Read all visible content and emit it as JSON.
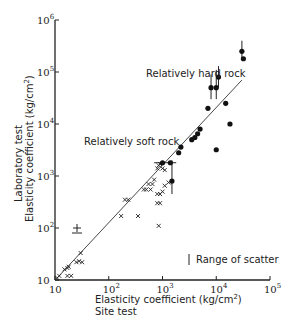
{
  "chart_data": {
    "type": "scatter",
    "title": "",
    "xlabel": "Elasticity coefficient (kg/cm²)",
    "xlabel_sub": "Site test",
    "ylabel": "Elasticity coefficient (kg/cm²)",
    "ylabel_sub": "Laboratory test",
    "xscale": "log",
    "yscale": "log",
    "xlim": [
      10,
      100000
    ],
    "ylim": [
      10,
      1000000
    ],
    "x_ticks": [
      {
        "base": "10",
        "exp": ""
      },
      {
        "base": "10",
        "exp": "2"
      },
      {
        "base": "10",
        "exp": "3"
      },
      {
        "base": "10",
        "exp": "4"
      },
      {
        "base": "10",
        "exp": "5"
      }
    ],
    "y_ticks": [
      {
        "base": "10",
        "exp": ""
      },
      {
        "base": "10",
        "exp": "2"
      },
      {
        "base": "10",
        "exp": "3"
      },
      {
        "base": "10",
        "exp": "4"
      },
      {
        "base": "10",
        "exp": "5"
      },
      {
        "base": "10",
        "exp": "6"
      }
    ],
    "grid": false,
    "annotations": [
      {
        "text": "Relatively hard rock",
        "x": 1200,
        "y": 80000
      },
      {
        "text": "Relatively soft rock",
        "x": 100,
        "y": 5500
      },
      {
        "text": "Range of scatter",
        "x": 5500,
        "y": 30
      }
    ],
    "reference_line": {
      "label": "y = x",
      "from": [
        11,
        11
      ],
      "to": [
        30000,
        70000
      ]
    },
    "series": [
      {
        "name": "Relatively soft rock",
        "marker": "x",
        "points": [
          [
            11,
            11
          ],
          [
            12,
            12
          ],
          [
            15,
            16
          ],
          [
            17,
            17
          ],
          [
            18,
            18
          ],
          [
            17,
            12
          ],
          [
            20,
            12
          ],
          [
            25,
            22
          ],
          [
            28,
            23
          ],
          [
            30,
            33
          ],
          [
            32,
            22
          ],
          [
            200,
            350
          ],
          [
            230,
            350
          ],
          [
            170,
            170
          ],
          [
            350,
            170
          ],
          [
            450,
            550
          ],
          [
            500,
            550
          ],
          [
            600,
            550
          ],
          [
            550,
            700
          ],
          [
            650,
            700
          ],
          [
            700,
            850
          ],
          [
            800,
            1400
          ],
          [
            900,
            1700
          ],
          [
            1000,
            1400
          ],
          [
            850,
            1600
          ],
          [
            1100,
            1300
          ],
          [
            1000,
            500
          ],
          [
            800,
            450
          ],
          [
            900,
            450
          ],
          [
            800,
            300
          ],
          [
            900,
            300
          ],
          [
            1100,
            650
          ],
          [
            1300,
            750
          ],
          [
            850,
            110
          ]
        ]
      },
      {
        "name": "Relatively hard rock",
        "marker": "filled-circle",
        "points": [
          [
            1000,
            1800
          ],
          [
            1400,
            1800
          ],
          [
            1500,
            800
          ],
          [
            2000,
            2800
          ],
          [
            2200,
            3600
          ],
          [
            3500,
            5000
          ],
          [
            4000,
            5500
          ],
          [
            4500,
            6500
          ],
          [
            5000,
            8000
          ],
          [
            7000,
            20000
          ],
          [
            8000,
            50000
          ],
          [
            10000,
            50000
          ],
          [
            11000,
            80000
          ],
          [
            10000,
            3200
          ],
          [
            15000,
            25000
          ],
          [
            18000,
            10000
          ],
          [
            30000,
            250000
          ],
          [
            32000,
            180000
          ]
        ]
      }
    ],
    "error_bars": [
      {
        "x": 1500,
        "y": 800,
        "low": 450,
        "high": 2000
      },
      {
        "x": 8000,
        "y": 50000,
        "low": 30000,
        "high": 90000
      },
      {
        "x": 10000,
        "y": 50000,
        "low": 30000,
        "high": 110000
      },
      {
        "x": 11000,
        "y": 80000,
        "low": 50000,
        "high": 130000
      },
      {
        "x": 30000,
        "y": 250000,
        "low": 180000,
        "high": 400000
      }
    ],
    "legend": {
      "text": "Range of scatter",
      "symbol": "vertical-bar",
      "position": "lower-right"
    }
  }
}
